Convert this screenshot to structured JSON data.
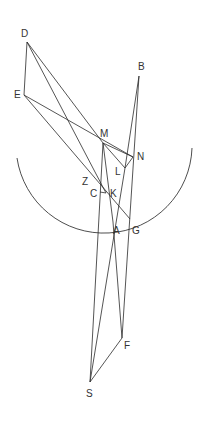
{
  "diagram": {
    "type": "geometric-construction",
    "points": {
      "D": {
        "label": "D",
        "x": 27,
        "y": 42,
        "lx": 21,
        "ly": 37
      },
      "E": {
        "label": "E",
        "x": 24,
        "y": 95,
        "lx": 14,
        "ly": 98
      },
      "B": {
        "label": "B",
        "x": 139,
        "y": 76,
        "lx": 138,
        "ly": 70
      },
      "M": {
        "label": "M",
        "x": 103,
        "y": 143,
        "lx": 100,
        "ly": 137
      },
      "N": {
        "label": "N",
        "x": 133,
        "y": 157,
        "lx": 137,
        "ly": 160
      },
      "L": {
        "label": "L",
        "x": 125,
        "y": 168,
        "lx": 115,
        "ly": 175
      },
      "Z": {
        "label": "Z",
        "x": 95,
        "y": 183,
        "lx": 82,
        "ly": 185
      },
      "C": {
        "label": "C",
        "x": 100,
        "y": 192,
        "lx": 90,
        "ly": 197
      },
      "K": {
        "label": "K",
        "x": 106,
        "y": 193,
        "lx": 110,
        "ly": 197
      },
      "A": {
        "label": "A",
        "x": 113,
        "y": 222,
        "lx": 113,
        "ly": 234
      },
      "G": {
        "label": "G",
        "x": 130,
        "y": 219,
        "lx": 132,
        "ly": 234
      },
      "F": {
        "label": "F",
        "x": 122,
        "y": 338,
        "lx": 124,
        "ly": 349
      },
      "S": {
        "label": "S",
        "x": 90,
        "y": 382,
        "lx": 86,
        "ly": 397
      }
    },
    "segments": [
      [
        "D",
        "E"
      ],
      [
        "D",
        "M"
      ],
      [
        "D",
        "K"
      ],
      [
        "E",
        "N"
      ],
      [
        "E",
        "G"
      ],
      [
        "M",
        "N"
      ],
      [
        "M",
        "L"
      ],
      [
        "L",
        "N"
      ],
      [
        "M",
        "A"
      ],
      [
        "M",
        "S"
      ],
      [
        "B",
        "L"
      ],
      [
        "B",
        "F"
      ],
      [
        "L",
        "S"
      ],
      [
        "A",
        "F"
      ],
      [
        "C",
        "K"
      ],
      [
        "S",
        "F"
      ]
    ],
    "arc": {
      "label": "circle-arc",
      "cx": 105,
      "cy": 143,
      "r": 88,
      "start_deg": 160,
      "end_deg": 5
    }
  }
}
